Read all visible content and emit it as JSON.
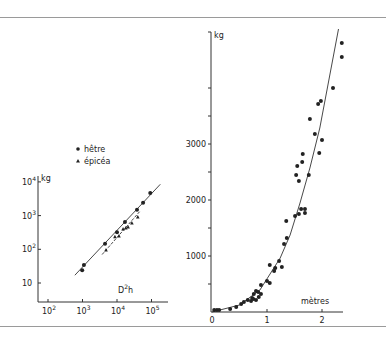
{
  "chart_data": [
    {
      "type": "scatter",
      "title": "",
      "xscale": "log",
      "yscale": "log",
      "xlabel": "D²h",
      "ylabel": "kg",
      "x_ticks": [
        "10²",
        "10³",
        "10⁴",
        "10⁵"
      ],
      "y_ticks": [
        "10",
        "10²",
        "10³",
        "10⁴"
      ],
      "xlim": [
        30,
        300000
      ],
      "ylim": [
        5,
        15000
      ],
      "grid": false,
      "legend": {
        "position": "top",
        "entries": [
          {
            "marker": "circle",
            "label": "hêtre"
          },
          {
            "marker": "triangle",
            "label": "épicéa"
          }
        ]
      },
      "series": [
        {
          "name": "hêtre",
          "marker": "circle",
          "points": [
            [
              980,
              24
            ],
            [
              1100,
              34
            ],
            [
              4500,
              145
            ],
            [
              10000,
              320
            ],
            [
              17000,
              650
            ],
            [
              38000,
              1500
            ],
            [
              57000,
              2400
            ],
            [
              92000,
              4700
            ]
          ],
          "fit_line": {
            "style": "solid",
            "from": [
              600,
              17
            ],
            "to": [
              180000,
              8500
            ]
          }
        },
        {
          "name": "épicéa",
          "marker": "triangle",
          "points": [
            [
              4800,
              96
            ],
            [
              8700,
              235
            ],
            [
              11400,
              250
            ],
            [
              15000,
              400
            ],
            [
              18000,
              430
            ],
            [
              21000,
              460
            ],
            [
              27000,
              600
            ],
            [
              40000,
              910
            ]
          ],
          "fit_line": {
            "style": "dashed",
            "from": [
              3700,
              70
            ],
            "to": [
              45000,
              1300
            ]
          }
        }
      ]
    },
    {
      "type": "scatter",
      "title": "",
      "xlabel": "mètres",
      "ylabel": "kg",
      "x_ticks": [
        "0",
        "1",
        "2"
      ],
      "y_ticks": [
        "1000",
        "2000",
        "3000"
      ],
      "y_minor_ticks": [
        500,
        1500,
        2500,
        3500,
        4000
      ],
      "xlim": [
        0,
        2.4
      ],
      "ylim": [
        0,
        5000
      ],
      "grid": false,
      "series": [
        {
          "name": "observations",
          "marker": "circle",
          "points": [
            [
              0.04,
              36
            ],
            [
              0.09,
              36
            ],
            [
              0.13,
              36
            ],
            [
              0.33,
              54
            ],
            [
              0.44,
              89
            ],
            [
              0.53,
              143
            ],
            [
              0.58,
              179
            ],
            [
              0.65,
              214
            ],
            [
              0.71,
              196
            ],
            [
              0.73,
              250
            ],
            [
              0.75,
              232
            ],
            [
              0.76,
              321
            ],
            [
              0.8,
              214
            ],
            [
              0.8,
              375
            ],
            [
              0.84,
              357
            ],
            [
              0.85,
              268
            ],
            [
              0.89,
              321
            ],
            [
              0.89,
              482
            ],
            [
              1.0,
              554
            ],
            [
              1.05,
              518
            ],
            [
              1.05,
              839
            ],
            [
              1.13,
              732
            ],
            [
              1.15,
              786
            ],
            [
              1.22,
              911
            ],
            [
              1.27,
              804
            ],
            [
              1.31,
              1214
            ],
            [
              1.35,
              1625
            ],
            [
              1.36,
              1321
            ],
            [
              1.51,
              1714
            ],
            [
              1.53,
              2446
            ],
            [
              1.55,
              2607
            ],
            [
              1.58,
              1750
            ],
            [
              1.58,
              2339
            ],
            [
              1.62,
              1839
            ],
            [
              1.64,
              2679
            ],
            [
              1.65,
              2821
            ],
            [
              1.69,
              1768
            ],
            [
              1.69,
              1839
            ],
            [
              1.76,
              2446
            ],
            [
              1.78,
              3446
            ],
            [
              1.87,
              3179
            ],
            [
              1.93,
              3714
            ],
            [
              1.95,
              2839
            ],
            [
              1.98,
              3768
            ],
            [
              2.0,
              3071
            ],
            [
              2.2,
              4000
            ],
            [
              2.36,
              4554
            ],
            [
              2.36,
              4804
            ]
          ]
        },
        {
          "name": "fitted curve",
          "type": "line",
          "points": [
            [
              0,
              0
            ],
            [
              0.5,
              125
            ],
            [
              0.87,
              393
            ],
            [
              1.24,
              964
            ],
            [
              1.42,
              1375
            ],
            [
              1.6,
              1946
            ],
            [
              1.78,
              2571
            ],
            [
              1.96,
              3286
            ],
            [
              2.3,
              5054
            ]
          ]
        }
      ]
    }
  ],
  "left": {
    "ylabel": "kg",
    "xlabel_base": "D",
    "xlabel_sup": "2",
    "xlabel_tail": "h",
    "legend": [
      {
        "symbol": "●",
        "label": "hêtre"
      },
      {
        "symbol": "▲",
        "label": "épicéa"
      }
    ],
    "yticks": [
      {
        "base": "10",
        "exp": "4"
      },
      {
        "base": "10",
        "exp": "3"
      },
      {
        "base": "10",
        "exp": "2"
      },
      {
        "base": "10",
        "exp": ""
      }
    ],
    "xticks": [
      {
        "base": "10",
        "exp": "2"
      },
      {
        "base": "10",
        "exp": "3"
      },
      {
        "base": "10",
        "exp": "4"
      },
      {
        "base": "10",
        "exp": "5"
      }
    ]
  },
  "right": {
    "ylabel": "kg",
    "xlabel": "mètres",
    "yticks": [
      "3000",
      "2000",
      "1000"
    ],
    "xticks": [
      "0",
      "1",
      "2"
    ]
  }
}
